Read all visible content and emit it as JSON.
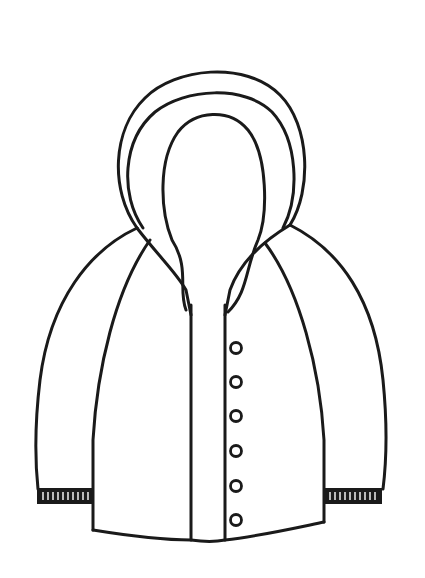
{
  "image": {
    "subject": "hooded jacket line drawing",
    "background": "#ffffff",
    "stroke_color": "#1a1a1a"
  },
  "jacket": {
    "hood": {
      "layers": 3
    },
    "sleeves": [
      "left",
      "right"
    ],
    "cuffs": {
      "style": "ribbed",
      "count": 2
    },
    "placket": {
      "lines": 2
    },
    "buttons": [
      {
        "cx": 236,
        "cy": 348
      },
      {
        "cx": 236,
        "cy": 382
      },
      {
        "cx": 236,
        "cy": 416
      },
      {
        "cx": 236,
        "cy": 451
      },
      {
        "cx": 236,
        "cy": 486
      },
      {
        "cx": 236,
        "cy": 520
      }
    ]
  }
}
